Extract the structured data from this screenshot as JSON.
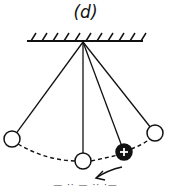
{
  "figure": {
    "panel_label": "(d)",
    "caption_partial": "— ·· — ·· ·—",
    "colors": {
      "ink": "#111111",
      "background": "#ffffff",
      "charged_bob": "#111111",
      "charge_symbol": "#ffffff"
    }
  },
  "ceiling": {
    "x1": 27,
    "x2": 143,
    "y": 41,
    "hatch_count": 11
  },
  "pivot": {
    "x": 83,
    "y": 42
  },
  "pendulums": [
    {
      "name": "left-bob",
      "x": 12,
      "y": 139,
      "r": 8,
      "charged": false
    },
    {
      "name": "middle-bob",
      "x": 83,
      "y": 161,
      "r": 8,
      "charged": false
    },
    {
      "name": "charged-bob",
      "x": 124,
      "y": 152,
      "r": 8,
      "charged": true,
      "charge_symbol": "+"
    },
    {
      "name": "right-bob",
      "x": 155,
      "y": 133,
      "r": 8,
      "charged": false
    }
  ],
  "arc": {
    "style": "dashed"
  },
  "arrow": {
    "from": [
      122,
      167
    ],
    "to": [
      96,
      178
    ],
    "meaning": "direction of motion"
  }
}
